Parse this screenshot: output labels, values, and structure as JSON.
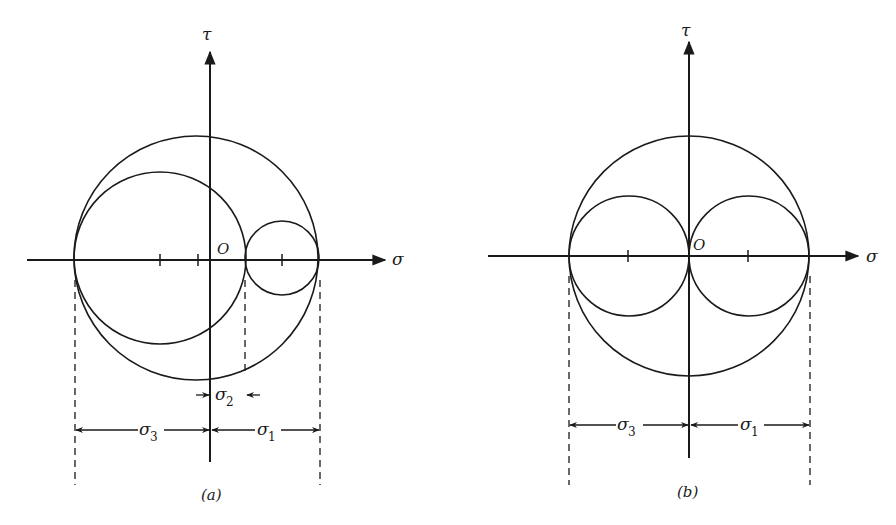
{
  "figure": {
    "panels": [
      {
        "id": "a",
        "caption": "(a)",
        "axes": {
          "horizontal_label": "σ",
          "vertical_label": "τ",
          "origin_label": "O"
        },
        "circles": [
          {
            "name": "outer",
            "from": "σ3",
            "to": "σ1"
          },
          {
            "name": "left",
            "from": "σ3",
            "to": "σ2"
          },
          {
            "name": "right",
            "from": "σ2",
            "to": "σ1"
          }
        ],
        "dimensions": [
          {
            "label": "σ",
            "subscript": "3"
          },
          {
            "label": "σ",
            "subscript": "1"
          },
          {
            "label": "σ",
            "subscript": "2"
          }
        ]
      },
      {
        "id": "b",
        "caption": "(b)",
        "axes": {
          "horizontal_label": "σ",
          "vertical_label": "τ",
          "origin_label": "O"
        },
        "circles": [
          {
            "name": "outer",
            "from": "σ3",
            "to": "σ1"
          },
          {
            "name": "left",
            "from": "σ3",
            "to": "0"
          },
          {
            "name": "right",
            "from": "0",
            "to": "σ1"
          }
        ],
        "dimensions": [
          {
            "label": "σ",
            "subscript": "3"
          },
          {
            "label": "σ",
            "subscript": "1"
          }
        ]
      }
    ]
  },
  "colors": {
    "ink": "#1a1a1a",
    "background": "#ffffff"
  }
}
